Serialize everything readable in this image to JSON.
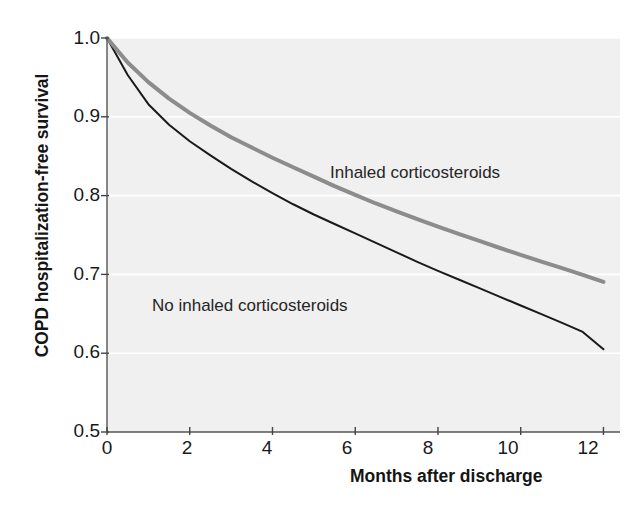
{
  "chart_data": {
    "type": "line",
    "title": "",
    "xlabel": "Months after discharge",
    "ylabel": "COPD hospitalization-free survival",
    "xlim": [
      0,
      12.4
    ],
    "ylim": [
      0.5,
      1.0
    ],
    "xticks": [
      0,
      2,
      4,
      6,
      8,
      10,
      12
    ],
    "xtick_labels": [
      "0",
      "2",
      "4",
      "6",
      "8",
      "10",
      "12"
    ],
    "yticks": [
      0.5,
      0.6,
      0.7,
      0.8,
      0.9,
      1.0
    ],
    "ytick_labels": [
      "0.5",
      "0.6",
      "0.7",
      "0.8",
      "0.9",
      "1.0"
    ],
    "grid": "horizontal-white",
    "plot_background": "#f0f0f0",
    "legend_position": "inline-annotations",
    "x": [
      0,
      0.5,
      1,
      1.5,
      2,
      2.5,
      3,
      3.5,
      4,
      4.5,
      5,
      5.5,
      6,
      6.5,
      7,
      7.5,
      8,
      8.5,
      9,
      9.5,
      10,
      10.5,
      11,
      11.5,
      12
    ],
    "series": [
      {
        "name": "Inhaled corticosteroids",
        "color": "#8c8c8c",
        "linewidth": 4.0,
        "values": [
          1.0,
          0.969,
          0.944,
          0.923,
          0.905,
          0.889,
          0.874,
          0.861,
          0.848,
          0.836,
          0.824,
          0.812,
          0.801,
          0.79,
          0.78,
          0.77,
          0.7605,
          0.7515,
          0.7425,
          0.7335,
          0.7248,
          0.7163,
          0.708,
          0.6995,
          0.6905
        ]
      },
      {
        "name": "No inhaled corticosteroids",
        "color": "#1a1a1a",
        "linewidth": 2.0,
        "values": [
          1.0,
          0.953,
          0.916,
          0.89,
          0.869,
          0.851,
          0.834,
          0.818,
          0.803,
          0.789,
          0.776,
          0.764,
          0.752,
          0.74,
          0.728,
          0.716,
          0.7045,
          0.6935,
          0.6825,
          0.6715,
          0.6605,
          0.6495,
          0.6385,
          0.627,
          0.605
        ]
      }
    ],
    "annotations": [
      {
        "text": "Inhaled corticosteroids",
        "x": 5.6,
        "y": 0.825
      },
      {
        "text": "No inhaled corticosteroids",
        "x": 1.2,
        "y": 0.655
      }
    ]
  }
}
